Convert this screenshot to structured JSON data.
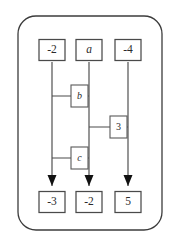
{
  "diagram": {
    "type": "circuit",
    "canvas": {
      "width": 179,
      "height": 246
    },
    "frame": {
      "name": "rounded-border",
      "x": 18,
      "y": 16,
      "width": 144,
      "height": 214,
      "radius": 18,
      "color": "#3c3c3c"
    },
    "colors": {
      "wire": "#4a4a4a",
      "box_border": "#4a4a4a",
      "box_fill": "#ffffff",
      "arrowhead": "#111111",
      "text": "#2b2b2b",
      "background": "#ffffff"
    },
    "wires": [
      {
        "name": "wire-left",
        "x": 52,
        "top_y": 62,
        "bottom_y": 186
      },
      {
        "name": "wire-middle",
        "x": 89,
        "top_y": 62,
        "bottom_y": 186
      },
      {
        "name": "wire-right",
        "x": 128,
        "top_y": 62,
        "bottom_y": 186
      }
    ],
    "inputs": [
      {
        "name": "input-box-left",
        "label": "-2",
        "italic": false,
        "x": 52,
        "y": 50,
        "width": 26,
        "height": 21
      },
      {
        "name": "input-box-middle",
        "label": "a",
        "italic": true,
        "x": 89,
        "y": 50,
        "width": 26,
        "height": 21
      },
      {
        "name": "input-box-right",
        "label": "-4",
        "italic": false,
        "x": 128,
        "y": 50,
        "width": 26,
        "height": 21
      }
    ],
    "gates": [
      {
        "name": "gate-b",
        "label": "b",
        "italic": true,
        "from_wire": "wire-left",
        "to_wire": "wire-middle",
        "rung_y": 96,
        "box_x": 71,
        "box_y": 85,
        "box_width": 17,
        "box_height": 22
      },
      {
        "name": "gate-3",
        "label": "3",
        "italic": false,
        "from_wire": "wire-middle",
        "to_wire": "wire-right",
        "rung_y": 127,
        "box_x": 110,
        "box_y": 116,
        "box_width": 17,
        "box_height": 22
      },
      {
        "name": "gate-c",
        "label": "c",
        "italic": true,
        "from_wire": "wire-left",
        "to_wire": "wire-middle",
        "rung_y": 158,
        "box_x": 71,
        "box_y": 147,
        "box_width": 17,
        "box_height": 22
      }
    ],
    "arrowheads": [
      {
        "name": "arrowhead-left",
        "x": 52,
        "tip_y": 186
      },
      {
        "name": "arrowhead-middle",
        "x": 89,
        "tip_y": 186
      },
      {
        "name": "arrowhead-right",
        "x": 128,
        "tip_y": 186
      }
    ],
    "outputs": [
      {
        "name": "output-box-left",
        "label": "-3",
        "italic": false,
        "x": 52,
        "y": 202,
        "width": 26,
        "height": 21
      },
      {
        "name": "output-box-middle",
        "label": "-2",
        "italic": false,
        "x": 89,
        "y": 202,
        "width": 26,
        "height": 21
      },
      {
        "name": "output-box-right",
        "label": "5",
        "italic": false,
        "x": 128,
        "y": 202,
        "width": 26,
        "height": 21
      }
    ]
  }
}
